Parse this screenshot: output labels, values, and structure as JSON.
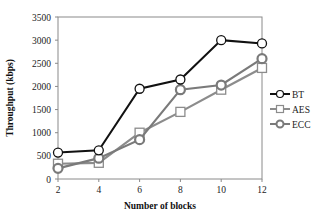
{
  "chart_data": {
    "type": "line",
    "title": "",
    "xlabel": "Number of blocks",
    "ylabel": "Throughput (kbps)",
    "x": [
      2,
      4,
      6,
      8,
      10,
      12
    ],
    "xlim": [
      2,
      12
    ],
    "ylim": [
      0,
      3500
    ],
    "yticks": [
      0,
      500,
      1000,
      1500,
      2000,
      2500,
      3000,
      3500
    ],
    "xticks": [
      2,
      4,
      6,
      8,
      10,
      12
    ],
    "grid": false,
    "legend_position": "right",
    "series": [
      {
        "name": "BT",
        "marker": "circle",
        "color": "#111111",
        "fill": "#ffffff",
        "values": [
          570,
          620,
          1950,
          2150,
          3000,
          2930
        ]
      },
      {
        "name": "AES",
        "marker": "square",
        "color": "#8c8c8c",
        "fill": "#ffffff",
        "values": [
          330,
          350,
          1000,
          1450,
          1930,
          2400
        ]
      },
      {
        "name": "ECC",
        "marker": "circle",
        "color": "#7a7a7a",
        "fill": "#ffffff",
        "values": [
          230,
          450,
          850,
          1930,
          2030,
          2600
        ]
      }
    ]
  }
}
